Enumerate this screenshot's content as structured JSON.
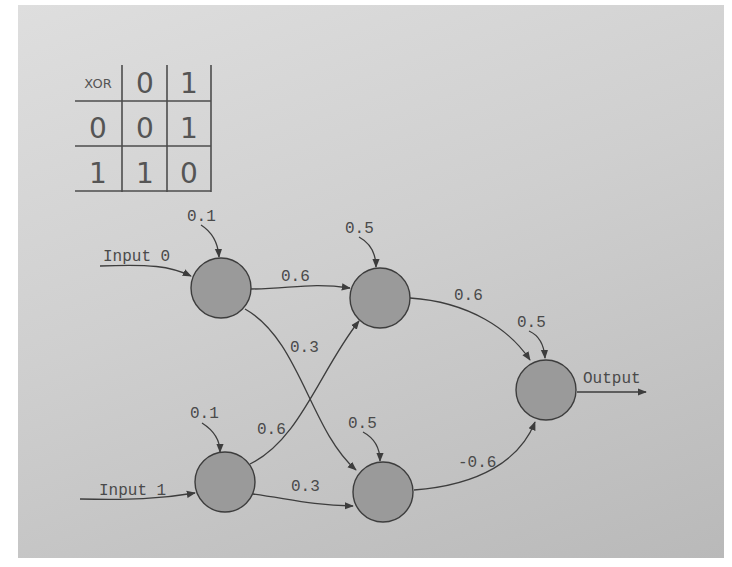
{
  "xor_table": {
    "corner_label": "XOR",
    "column_headers": [
      "0",
      "1"
    ],
    "rows": [
      {
        "header": "0",
        "cells": [
          "0",
          "1"
        ]
      },
      {
        "header": "1",
        "cells": [
          "1",
          "0"
        ]
      }
    ]
  },
  "network": {
    "inputs": [
      {
        "id": "input-0",
        "label": "Input 0"
      },
      {
        "id": "input-1",
        "label": "Input 1"
      }
    ],
    "output_label": "Output",
    "nodes": [
      {
        "id": "in0",
        "layer": "input",
        "bias": "0.1"
      },
      {
        "id": "in1",
        "layer": "input",
        "bias": "0.1"
      },
      {
        "id": "h0",
        "layer": "hidden",
        "bias": "0.5"
      },
      {
        "id": "h1",
        "layer": "hidden",
        "bias": "0.5"
      },
      {
        "id": "out",
        "layer": "output",
        "bias": "0.5"
      }
    ],
    "edges": [
      {
        "from": "in0",
        "to": "h0",
        "weight": "0.6"
      },
      {
        "from": "in0",
        "to": "h1",
        "weight": "0.3"
      },
      {
        "from": "in1",
        "to": "h0",
        "weight": "0.6"
      },
      {
        "from": "in1",
        "to": "h1",
        "weight": "0.3"
      },
      {
        "from": "h0",
        "to": "out",
        "weight": "0.6"
      },
      {
        "from": "h1",
        "to": "out",
        "weight": "-0.6"
      }
    ]
  }
}
